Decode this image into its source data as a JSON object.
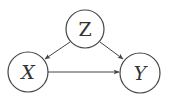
{
  "diagram": {
    "type": "causal-dag",
    "colors": {
      "stroke": "#444444",
      "text": "#333333",
      "background": "#ffffff"
    },
    "nodes": [
      {
        "id": "Z",
        "label": "Z",
        "cx": 85,
        "cy": 29,
        "r": 19
      },
      {
        "id": "X",
        "label": "X",
        "cx": 28,
        "cy": 72,
        "r": 20
      },
      {
        "id": "Y",
        "label": "Y",
        "cx": 140,
        "cy": 73,
        "r": 20
      }
    ],
    "edges": [
      {
        "from": "Z",
        "to": "X"
      },
      {
        "from": "Z",
        "to": "Y"
      },
      {
        "from": "X",
        "to": "Y"
      }
    ]
  }
}
